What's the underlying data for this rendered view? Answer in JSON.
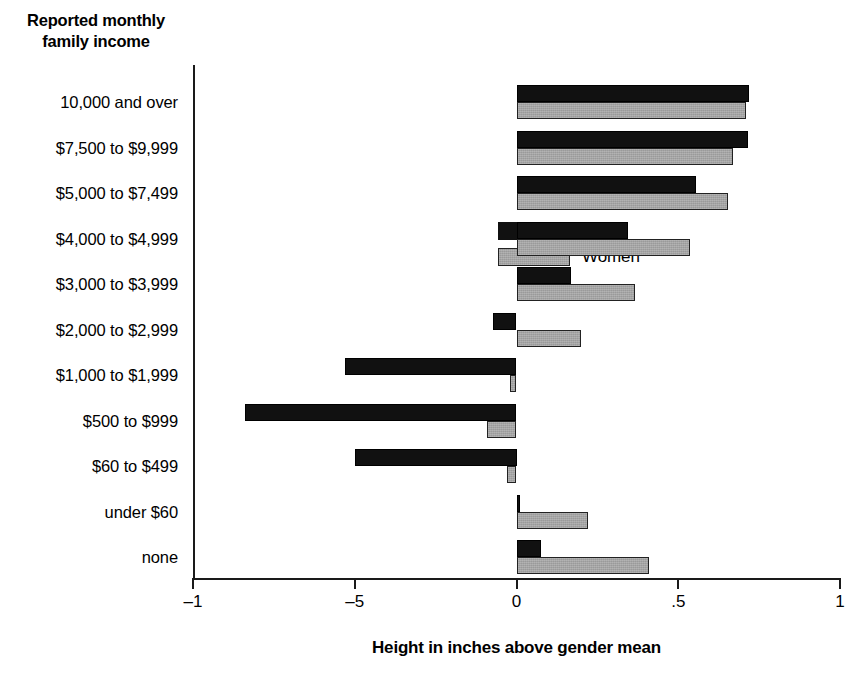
{
  "chart_data": {
    "type": "bar",
    "orientation": "horizontal",
    "title": "",
    "y_heading_line1": "Reported monthly",
    "y_heading_line2": "family income",
    "xlabel": "Height in inches above gender mean",
    "ylabel": "",
    "xlim": [
      -1,
      1
    ],
    "xticks": [
      -1,
      -0.5,
      0,
      0.5,
      1
    ],
    "xticklabels": [
      "–1",
      "–5",
      "0",
      ".5",
      "1"
    ],
    "grid": false,
    "legend_position": "upper-left-inside",
    "categories": [
      "10,000 and over",
      "$7,500 to $9,999",
      "$5,000 to $7,499",
      "$4,000 to $4,999",
      "$3,000 to $3,999",
      "$2,000 to $2,999",
      "$1,000 to $1,999",
      "$500 to $999",
      "$60 to $499",
      "under $60",
      "none"
    ],
    "series": [
      {
        "name": "Men",
        "color": "#111111",
        "values": [
          0.72,
          0.715,
          0.555,
          0.345,
          0.17,
          -0.073,
          -0.53,
          -0.84,
          -0.5,
          0.012,
          0.075
        ]
      },
      {
        "name": "Women",
        "color": "#9a9a9a",
        "values": [
          0.71,
          0.67,
          0.655,
          0.535,
          0.365,
          0.2,
          -0.02,
          -0.09,
          -0.03,
          0.22,
          0.41
        ]
      }
    ]
  },
  "legend": {
    "items": [
      {
        "label": "Men",
        "color": "#111111"
      },
      {
        "label": "Women",
        "color": "#9a9a9a"
      }
    ]
  }
}
